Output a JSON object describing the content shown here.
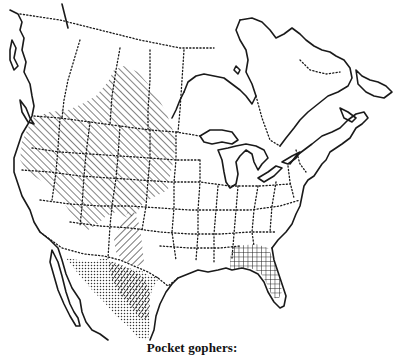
{
  "map": {
    "caption": "Pocket gophers:",
    "region": "North America (Canada, United States, Mexico)",
    "background_color": "#ffffff",
    "ink_color": "#1a1a1a",
    "ranges": [
      {
        "name": "northern-plains-western-range",
        "pattern": "diagonal-hatch",
        "area": "Western US and southern Canadian prairies"
      },
      {
        "name": "southwest-plains-range",
        "pattern": "reverse-diagonal-hatch",
        "area": "New Mexico / west Texas"
      },
      {
        "name": "mexico-range",
        "pattern": "stipple-dots",
        "area": "Northern and central Mexico"
      },
      {
        "name": "overlap-range",
        "pattern": "dense-diagonal-hatch",
        "area": "West Texas / Chihuahua overlap"
      },
      {
        "name": "southeastern-range",
        "pattern": "crosshatch-grid",
        "area": "Georgia, Alabama, Florida"
      }
    ]
  }
}
